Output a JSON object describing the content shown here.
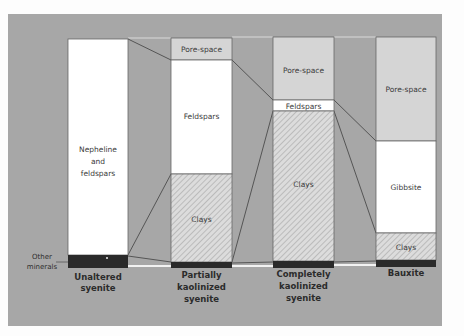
{
  "diagram": {
    "colors": {
      "background": "#a7a7a7",
      "pore_space": "#d5d5d5",
      "mineral_white": "#ffffff",
      "clay_hatch_bg": "#dcdcdc",
      "clay_hatch_line": "#9a9a9a",
      "other_minerals": "#2a2a2a",
      "connector": "#555555"
    },
    "side_label": {
      "line1": "Other",
      "line2": "minerals"
    },
    "columns": [
      {
        "id": "unaltered",
        "caption": [
          "Unaltered",
          "syenite"
        ],
        "layers": [
          {
            "name": "Nepheline and feldspars",
            "label_lines": [
              "Nepheline",
              "and",
              "feldspars"
            ],
            "type": "white"
          },
          {
            "name": "Other minerals",
            "label_lines": [
              "°"
            ],
            "type": "dark"
          }
        ]
      },
      {
        "id": "partially-kaolinized",
        "caption": [
          "Partially",
          "kaolinized",
          "syenite"
        ],
        "layers": [
          {
            "name": "Pore-space",
            "label_lines": [
              "Pore-space"
            ],
            "type": "pore"
          },
          {
            "name": "Feldspars",
            "label_lines": [
              "Feldspars"
            ],
            "type": "white"
          },
          {
            "name": "Clays",
            "label_lines": [
              "Clays"
            ],
            "type": "hatch"
          },
          {
            "name": "Other minerals",
            "label_lines": [],
            "type": "dark"
          }
        ]
      },
      {
        "id": "completely-kaolinized",
        "caption": [
          "Completely",
          "kaolinized",
          "syenite"
        ],
        "layers": [
          {
            "name": "Pore-space",
            "label_lines": [
              "Pore-space"
            ],
            "type": "pore"
          },
          {
            "name": "Feldspars",
            "label_lines": [
              "Feldspars"
            ],
            "type": "white"
          },
          {
            "name": "Clays",
            "label_lines": [
              "Clays"
            ],
            "type": "hatch"
          },
          {
            "name": "Other minerals",
            "label_lines": [],
            "type": "dark"
          }
        ]
      },
      {
        "id": "bauxite",
        "caption": [
          "Bauxite"
        ],
        "layers": [
          {
            "name": "Pore-space",
            "label_lines": [
              "Pore-space"
            ],
            "type": "pore"
          },
          {
            "name": "Gibbsite",
            "label_lines": [
              "Gibbsite"
            ],
            "type": "white"
          },
          {
            "name": "Clays",
            "label_lines": [
              "Clays"
            ],
            "type": "hatch"
          },
          {
            "name": "Other minerals",
            "label_lines": [],
            "type": "dark"
          }
        ]
      }
    ]
  }
}
